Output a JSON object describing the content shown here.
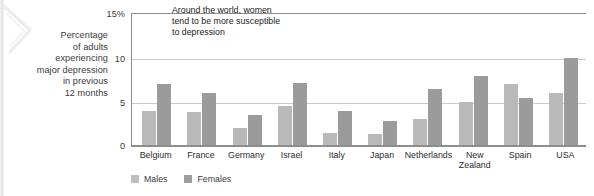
{
  "y_axis_caption": "Percentage\nof adults\nexperiencing\nmajor depression\nin previous\n12 months",
  "annotation": "Around the world, women\ntend to be more susceptible\nto depression",
  "legend": {
    "males_label": "Males",
    "females_label": "Females"
  },
  "colors": {
    "males": "#b9b9b9",
    "females": "#9b9b9b",
    "axis": "#8d8d8d",
    "gridline": "#c9c9c9",
    "text": "#2c2c2c"
  },
  "chart_data": {
    "type": "bar",
    "title": "",
    "subtitle": "",
    "xlabel": "",
    "ylabel": "Percentage of adults experiencing major depression in previous 12 months",
    "ylim": [
      0,
      15
    ],
    "yticks": [
      "0",
      "5",
      "10",
      "15%"
    ],
    "ytick_values": [
      0,
      5,
      10,
      15
    ],
    "grid": true,
    "legend_position": "bottom-left",
    "annotations": [
      "Around the world, women tend to be more susceptible to depression"
    ],
    "categories": [
      "Belgium",
      "France",
      "Germany",
      "Israel",
      "Italy",
      "Japan",
      "Netherlands",
      "New Zealand",
      "Spain",
      "USA"
    ],
    "series": [
      {
        "name": "Males",
        "values": [
          4.0,
          3.9,
          2.1,
          4.6,
          1.6,
          1.5,
          3.1,
          5.0,
          7.0,
          6.0
        ]
      },
      {
        "name": "Females",
        "values": [
          7.0,
          6.0,
          3.6,
          7.2,
          4.0,
          2.9,
          6.5,
          7.9,
          5.5,
          10.0
        ]
      }
    ]
  }
}
